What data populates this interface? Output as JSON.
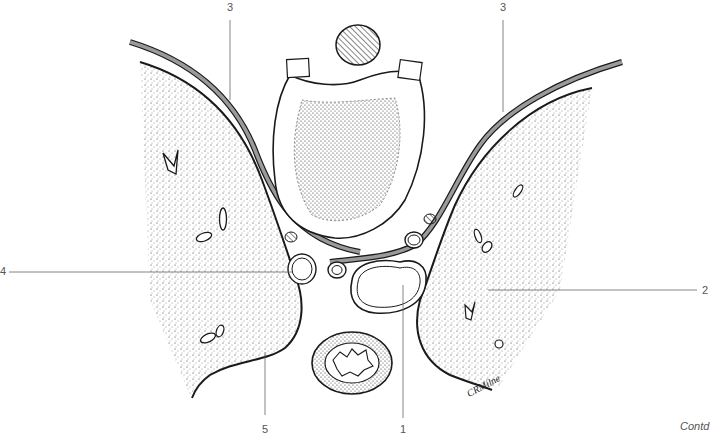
{
  "figure": {
    "type": "anatomical cross-section illustration",
    "labels": [
      {
        "id": "1",
        "text": "1",
        "x": 400,
        "y": 428
      },
      {
        "id": "2",
        "text": "2",
        "x": 704,
        "y": 296
      },
      {
        "id": "3a",
        "text": "3",
        "x": 227,
        "y": 10
      },
      {
        "id": "3b",
        "text": "3",
        "x": 502,
        "y": 10
      },
      {
        "id": "4",
        "text": "4",
        "x": 0,
        "y": 271
      },
      {
        "id": "5",
        "text": "5",
        "x": 262,
        "y": 428
      }
    ],
    "leader_lines": [
      {
        "label": "1",
        "x1": 403,
        "y1": 285,
        "x2": 403,
        "y2": 418
      },
      {
        "label": "2",
        "x1": 488,
        "y1": 290,
        "x2": 697,
        "y2": 290
      },
      {
        "label": "3a",
        "x1": 230,
        "y1": 20,
        "x2": 230,
        "y2": 100
      },
      {
        "label": "3b",
        "x1": 503,
        "y1": 20,
        "x2": 503,
        "y2": 112
      },
      {
        "label": "4",
        "x1": 9,
        "y1": 272,
        "x2": 292,
        "y2": 272
      },
      {
        "label": "5",
        "x1": 265,
        "y1": 352,
        "x2": 265,
        "y2": 415
      }
    ],
    "signature": "CRMilne",
    "footer_note": "Contd"
  },
  "colors": {
    "line": "#1a1a1a",
    "fascia_band": "#9a9a9a",
    "label_text": "#555555",
    "leader": "#666666",
    "stipple": "#333333",
    "background": "#ffffff"
  }
}
